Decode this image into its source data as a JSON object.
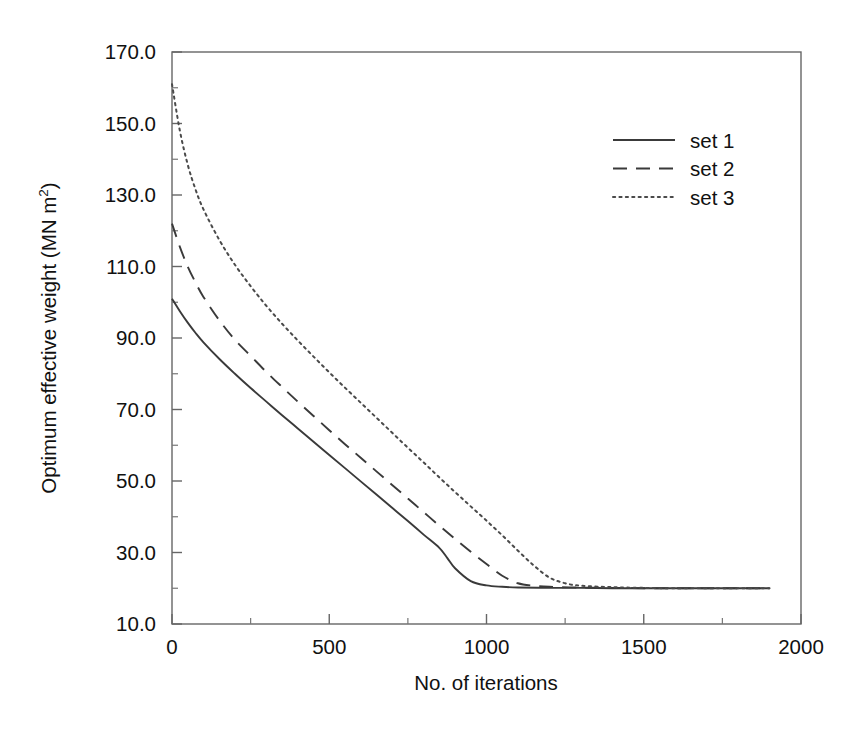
{
  "chart_data": {
    "type": "line",
    "title": "",
    "xlabel": "No. of iterations",
    "ylabel": "Optimum effective weight (MN m2)",
    "ylabel_main": "Optimum effective weight (MN m",
    "ylabel_sup": "2",
    "ylabel_tail": ")",
    "xlim": [
      0,
      2000
    ],
    "ylim": [
      10.0,
      170.0
    ],
    "grid": false,
    "legend_position": "upper right",
    "x_ticks": [
      0,
      500,
      1000,
      1500,
      2000
    ],
    "x_tick_labels": [
      "0",
      "500",
      "1000",
      "1500",
      "2000"
    ],
    "x_minor_step": 250,
    "y_ticks": [
      10.0,
      30.0,
      50.0,
      70.0,
      90.0,
      110.0,
      130.0,
      150.0,
      170.0
    ],
    "y_tick_labels": [
      "10.0",
      "30.0",
      "50.0",
      "70.0",
      "90.0",
      "110.0",
      "130.0",
      "150.0",
      "170.0"
    ],
    "y_minor_step": 10,
    "series": [
      {
        "name": "set 1",
        "style": "solid",
        "color": "#3a3a3a",
        "x": [
          0,
          25,
          50,
          75,
          100,
          150,
          200,
          250,
          300,
          350,
          400,
          450,
          500,
          550,
          600,
          650,
          700,
          750,
          800,
          850,
          875,
          900,
          950,
          1000,
          1050,
          1100,
          1200,
          1300,
          1400,
          1500,
          1600,
          1700,
          1800,
          1900
        ],
        "y": [
          101.0,
          97.5,
          94.3,
          91.4,
          88.8,
          84.2,
          80.0,
          76.0,
          72.2,
          68.4,
          64.7,
          61.0,
          57.3,
          53.6,
          49.9,
          46.2,
          42.5,
          38.8,
          35.0,
          31.3,
          28.5,
          25.6,
          22.0,
          20.8,
          20.4,
          20.2,
          20.1,
          20.1,
          20.0,
          20.0,
          20.0,
          20.0,
          20.0,
          20.0
        ]
      },
      {
        "name": "set 2",
        "style": "dashed",
        "color": "#3a3a3a",
        "x": [
          0,
          25,
          50,
          75,
          100,
          150,
          200,
          250,
          300,
          350,
          400,
          450,
          500,
          550,
          600,
          650,
          700,
          750,
          800,
          850,
          900,
          950,
          1000,
          1050,
          1100,
          1150,
          1200,
          1300,
          1400,
          1500,
          1600,
          1700,
          1800,
          1900
        ],
        "y": [
          122.0,
          115.5,
          110.0,
          105.5,
          101.5,
          95.0,
          89.5,
          85.0,
          80.5,
          76.3,
          72.2,
          68.2,
          64.2,
          60.3,
          56.5,
          52.7,
          48.9,
          45.1,
          41.3,
          37.5,
          33.8,
          30.2,
          26.8,
          23.5,
          21.4,
          20.7,
          20.4,
          20.2,
          20.1,
          20.0,
          20.0,
          20.0,
          20.0,
          20.0
        ]
      },
      {
        "name": "set 3",
        "style": "dotted",
        "color": "#4a4a4a",
        "x": [
          0,
          25,
          50,
          75,
          100,
          150,
          200,
          250,
          300,
          350,
          400,
          450,
          500,
          550,
          600,
          650,
          700,
          750,
          800,
          850,
          900,
          950,
          1000,
          1050,
          1100,
          1150,
          1200,
          1250,
          1300,
          1400,
          1500,
          1600,
          1700,
          1800,
          1900
        ],
        "y": [
          161.0,
          148.0,
          138.5,
          131.5,
          126.0,
          117.5,
          110.5,
          104.5,
          99.0,
          94.0,
          89.3,
          84.8,
          80.4,
          76.1,
          71.9,
          67.7,
          63.5,
          59.3,
          55.2,
          51.0,
          46.9,
          42.9,
          38.9,
          34.8,
          30.5,
          26.4,
          23.0,
          21.4,
          20.7,
          20.3,
          20.1,
          20.0,
          20.0,
          20.0,
          20.0
        ]
      }
    ]
  },
  "legend": {
    "entries": [
      {
        "label": "set 1",
        "style": "solid"
      },
      {
        "label": "set 2",
        "style": "dashed"
      },
      {
        "label": "set 3",
        "style": "dotted"
      }
    ]
  },
  "colors": {
    "axis": "#555555",
    "line": "#3a3a3a",
    "background": "#ffffff"
  }
}
